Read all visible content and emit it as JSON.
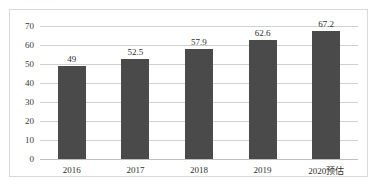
{
  "clipped_top_text": "· ··· · ·· ···",
  "chart_data": {
    "type": "bar",
    "title": "",
    "subtitle": "",
    "xlabel": "",
    "ylabel": "",
    "categories": [
      "2016",
      "2017",
      "2018",
      "2019",
      "2020预估"
    ],
    "values": [
      49,
      52.5,
      57.9,
      62.6,
      67.2
    ],
    "data_labels": [
      "49",
      "52.5",
      "57.9",
      "62.6",
      "67.2"
    ],
    "ylim": [
      0,
      70
    ],
    "ytick_values": [
      70,
      60,
      50,
      40,
      30,
      20,
      10,
      0
    ],
    "ytick_labels": [
      "70",
      "60",
      "50",
      "40",
      "30",
      "20",
      "10",
      "0"
    ],
    "grid": true,
    "grid_axis": "y",
    "legend": false,
    "legend_position": "none",
    "series": [
      {
        "name": "",
        "values": [
          49,
          52.5,
          57.9,
          62.6,
          67.2
        ],
        "color": "#4A4A4A"
      }
    ],
    "colors": {
      "bar": "#4A4A4A",
      "gridline": "#D0D0D0",
      "baseline": "#BFBFBF",
      "frame_border": "#D9D9D9",
      "text": "#2F2F2F",
      "background": "#FFFFFF"
    }
  }
}
